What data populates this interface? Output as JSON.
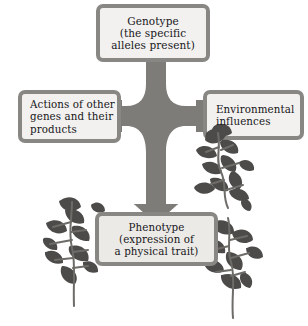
{
  "diagram": {
    "type": "flow-diagram",
    "background_color": "#ffffff",
    "box_fill_color": "#f2f1ef",
    "box_border_color": "#888783",
    "arrow_color": "#7d7c79",
    "text_color": "#17161a",
    "boxes": [
      {
        "id": "genotype",
        "lines": [
          "Genotype",
          "(the specific",
          "alleles present)"
        ],
        "align": "center",
        "position": "top-center"
      },
      {
        "id": "actions",
        "lines": [
          "Actions of other",
          "genes and their",
          "products"
        ],
        "align": "left",
        "position": "middle-left"
      },
      {
        "id": "environment",
        "lines": [
          "Environmental",
          "influences"
        ],
        "align": "left",
        "position": "middle-right"
      },
      {
        "id": "phenotype",
        "lines": [
          "Phenotype",
          "(expression of",
          "a physical trait)"
        ],
        "align": "center",
        "position": "bottom-center"
      }
    ],
    "connectors": [
      {
        "id": "genotype-to-phenotype",
        "from": "genotype",
        "to": "phenotype",
        "style": "thick-arrow-down"
      },
      {
        "id": "actions-to-trunk",
        "from": "actions",
        "to": "genotype-to-phenotype",
        "style": "thick-arm-right"
      },
      {
        "id": "environment-to-trunk",
        "from": "environment",
        "to": "genotype-to-phenotype",
        "style": "thick-arm-left"
      }
    ],
    "illustration": {
      "name": "morning-glory-vine",
      "description": "grayscale flowering vine plants flanking the phenotype box",
      "leaf_color": "#4d4b49",
      "stem_color": "#6e6c68"
    }
  }
}
